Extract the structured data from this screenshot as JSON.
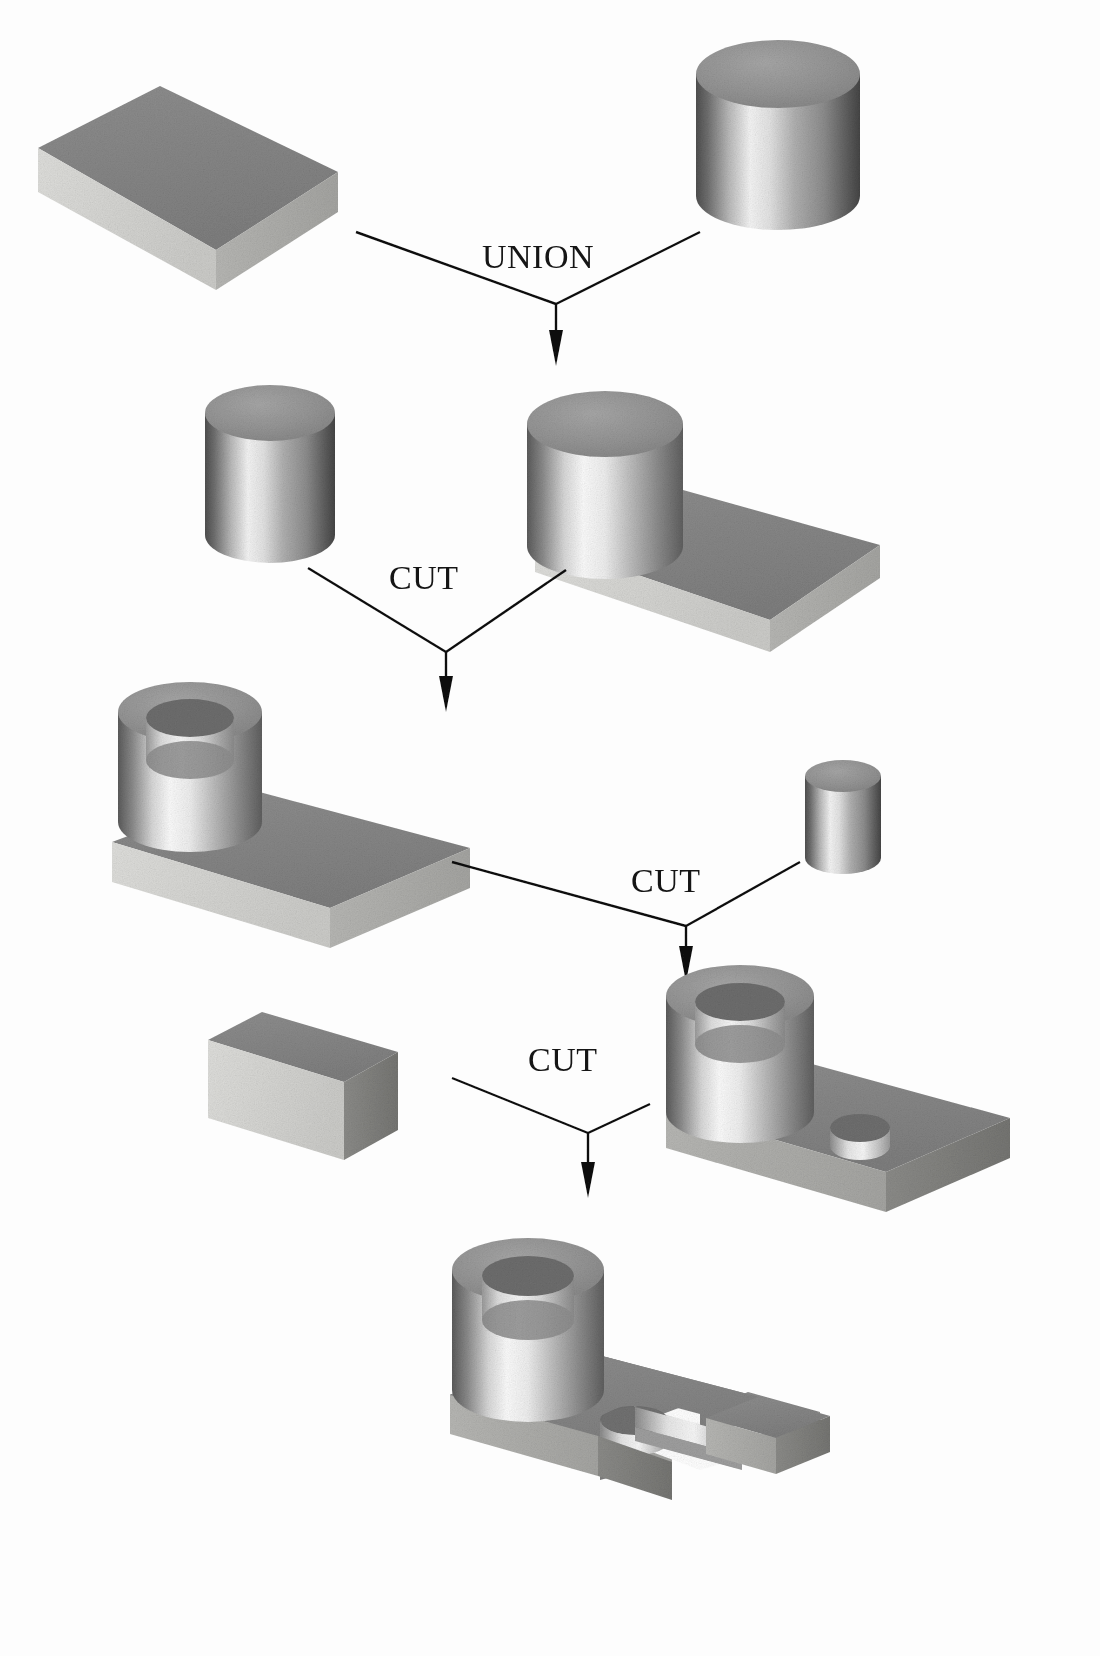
{
  "diagram": {
    "background_color": "#fdfdfd",
    "line_color": "#111111",
    "palette": {
      "top_face_dark": "#8f8f8f",
      "top_face_mid": "#9a9a9a",
      "side_face_light": "#d6d6d6",
      "side_face_mid": "#b4b4b4",
      "side_face_dark": "#6f6f6f",
      "highlight": "#f2f2f2",
      "shadow": "#5a5a5a",
      "bore_dark": "#7d7d7d"
    },
    "operations": [
      {
        "id": "op-union",
        "label": "UNION",
        "x": 482,
        "y": 238
      },
      {
        "id": "op-cut-1",
        "label": "CUT",
        "x": 389,
        "y": 559
      },
      {
        "id": "op-cut-2",
        "label": "CUT",
        "x": 631,
        "y": 862
      },
      {
        "id": "op-cut-3",
        "label": "CUT",
        "x": 528,
        "y": 1041
      }
    ],
    "rows": [
      {
        "id": "row-1",
        "nodes": [
          {
            "id": "block-primitive",
            "name": "rectangular-block",
            "role": "operand"
          },
          {
            "id": "cylinder-primitive-large",
            "name": "large-cylinder",
            "role": "operand"
          }
        ]
      },
      {
        "id": "row-2",
        "nodes": [
          {
            "id": "cylinder-primitive-bore",
            "name": "bore-cylinder",
            "role": "operand"
          },
          {
            "id": "union-result",
            "name": "block-with-boss",
            "role": "result"
          }
        ]
      },
      {
        "id": "row-3",
        "nodes": [
          {
            "id": "cut-1-result",
            "name": "block-with-hollow-boss",
            "role": "result"
          },
          {
            "id": "cylinder-primitive-small",
            "name": "small-cylinder",
            "role": "operand"
          }
        ]
      },
      {
        "id": "row-4",
        "nodes": [
          {
            "id": "slab-primitive",
            "name": "thin-slab",
            "role": "operand"
          },
          {
            "id": "cut-2-result",
            "name": "flange-with-small-hole",
            "role": "result"
          }
        ]
      },
      {
        "id": "row-5",
        "nodes": [
          {
            "id": "cut-3-result",
            "name": "final-part-with-slot",
            "role": "result"
          }
        ]
      }
    ],
    "arrows": [
      {
        "id": "arrow-union",
        "from": [
          "block-primitive",
          "cylinder-primitive-large"
        ],
        "to": "union-result"
      },
      {
        "id": "arrow-cut-1",
        "from": [
          "cylinder-primitive-bore",
          "union-result"
        ],
        "to": "cut-1-result"
      },
      {
        "id": "arrow-cut-2",
        "from": [
          "cut-1-result",
          "cylinder-primitive-small"
        ],
        "to": "cut-2-result"
      },
      {
        "id": "arrow-cut-3",
        "from": [
          "slab-primitive",
          "cut-2-result"
        ],
        "to": "cut-3-result"
      }
    ]
  }
}
